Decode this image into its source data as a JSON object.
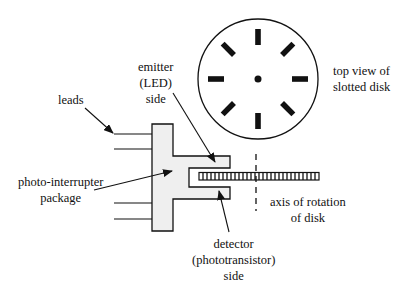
{
  "diagram": {
    "labels": {
      "leads": "leads",
      "emitter": [
        "emitter",
        "(LED)",
        "side"
      ],
      "package": [
        "photo-interrupter",
        "package"
      ],
      "detector": [
        "detector",
        "(phototransistor)",
        "side"
      ],
      "axis": [
        "axis of rotation",
        "of disk"
      ],
      "top_view": [
        "top view of",
        "slotted disk"
      ]
    },
    "disk": {
      "slot_count": 8
    },
    "colors": {
      "stroke": "#111111",
      "package_fill": "#efefef",
      "background": "#ffffff"
    }
  }
}
